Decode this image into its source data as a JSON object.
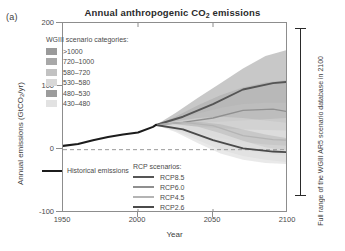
{
  "panel": {
    "label": "(a)"
  },
  "chart_data": {
    "type": "area",
    "title": "Annual anthropogenic CO2 emissions",
    "title_parts": {
      "pre": "Annual anthropogenic CO",
      "sub": "2",
      "post": " emissions"
    },
    "xlabel": "Year",
    "ylabel": "Annual emissions (GtCO2/yr)",
    "ylabel_parts": {
      "pre": "Annual emissions (GtCO",
      "sub": "2",
      "post": "/yr)"
    },
    "xlim": [
      1950,
      2100
    ],
    "ylim": [
      -100,
      200
    ],
    "xticks": [
      1950,
      2000,
      2050,
      2100
    ],
    "yticks": [
      -100,
      0,
      100,
      200
    ],
    "grid": false,
    "zero_line": true,
    "legend_position": "inside",
    "historical": {
      "name": "Historical emissions",
      "color": "#1c1c1c",
      "x": [
        1950,
        1960,
        1970,
        1980,
        1990,
        2000,
        2010,
        2012
      ],
      "y": [
        6,
        9,
        15,
        20,
        24,
        27,
        36,
        39
      ]
    },
    "wg3_categories": {
      "header": "WGIII scenario categories:",
      "items": [
        {
          "label": ">1000",
          "color": "#9a9a9a"
        },
        {
          "label": "720–1000",
          "color": "#a8a8a8"
        },
        {
          "label": "580–720",
          "color": "#c2c2c2"
        },
        {
          "label": "530–580",
          "color": "#d8d8d8"
        },
        {
          "label": "480–530",
          "color": "#9c9c9c"
        },
        {
          "label": "430–480",
          "color": "#e2e2e2"
        }
      ]
    },
    "rcp_scenarios": {
      "header": "RCP scenarios:",
      "items": [
        {
          "label": "RCP8.5",
          "color": "#555555",
          "x": [
            2012,
            2030,
            2050,
            2070,
            2090,
            2100
          ],
          "y": [
            39,
            52,
            72,
            95,
            105,
            107
          ]
        },
        {
          "label": "RCP6.0",
          "color": "#8f8f8f",
          "x": [
            2012,
            2030,
            2050,
            2070,
            2090,
            2100
          ],
          "y": [
            39,
            43,
            50,
            62,
            64,
            60
          ]
        },
        {
          "label": "RCP4.5",
          "color": "#b4b4b4",
          "x": [
            2012,
            2030,
            2050,
            2070,
            2090,
            2100
          ],
          "y": [
            39,
            43,
            38,
            22,
            16,
            15
          ]
        },
        {
          "label": "RCP2.6",
          "color": "#4a4a4a",
          "x": [
            2012,
            2030,
            2050,
            2070,
            2090,
            2100
          ],
          "y": [
            39,
            32,
            15,
            2,
            -3,
            -4
          ]
        }
      ]
    },
    "annotation": {
      "text": "Full range of the WGIII AR5 scenario database in 2100",
      "bracket_range": [
        -23,
        158
      ]
    }
  }
}
